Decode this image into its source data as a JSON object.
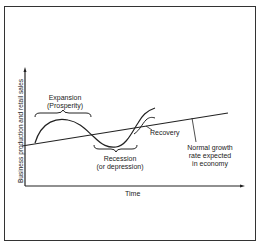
{
  "diagram": {
    "y_axis_label": "Business production and retail sales",
    "x_axis_label": "Time",
    "annotations": {
      "expansion": [
        "Expansion",
        "(Prosperity)"
      ],
      "recession": [
        "Recession",
        "(or depression)"
      ],
      "recovery": "Recovery",
      "trend": [
        "Normal growth",
        "rate expected",
        "in economy"
      ]
    },
    "colors": {
      "ink": "#222222",
      "background": "#ffffff"
    }
  }
}
